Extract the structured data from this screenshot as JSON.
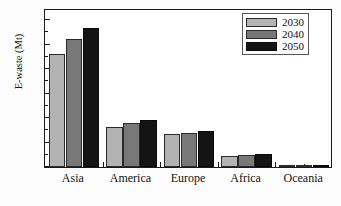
{
  "chart_data": {
    "type": "bar",
    "title": "",
    "xlabel": "",
    "ylabel": "E-waste (Mt)",
    "categories": [
      "Asia",
      "America",
      "Europe",
      "Africa",
      "Oceania"
    ],
    "series": [
      {
        "name": "2030",
        "color": "#b3b3b3",
        "values": [
          46.3,
          16.3,
          13.6,
          4.3,
          0.7
        ]
      },
      {
        "name": "2040",
        "color": "#787878",
        "values": [
          52.4,
          17.8,
          14.1,
          4.8,
          0.8
        ]
      },
      {
        "name": "2050",
        "color": "#141414",
        "values": [
          57.0,
          19.2,
          14.6,
          5.2,
          0.9
        ]
      }
    ],
    "ylim": [
      0,
      65
    ],
    "yticks": [
      0,
      10,
      20,
      30,
      40,
      50,
      60
    ],
    "ytick_labels": [
      "0",
      "10",
      "20",
      "30",
      "40",
      "50",
      "60"
    ],
    "yminor_step": 5,
    "grid": false,
    "legend_position": "top-right",
    "legend_entries": [
      "2030",
      "2040",
      "2050"
    ],
    "axis_color": "#1a1a1a",
    "background_color": "#ffffff"
  }
}
